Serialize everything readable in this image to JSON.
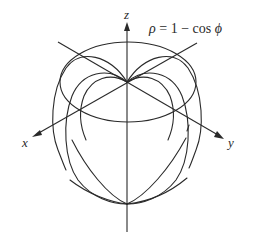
{
  "figure": {
    "equation": {
      "rho": "ρ",
      "rest": " = 1 − cos ",
      "phi": "ϕ"
    },
    "axis_labels": {
      "x": "x",
      "y": "y",
      "z": "z"
    },
    "colors": {
      "stroke": "#2a2a2a",
      "background": "#ffffff"
    },
    "geometry": {
      "origin": [
        127,
        82
      ],
      "bottom_point": [
        127,
        204
      ],
      "equator_ellipse": {
        "cx": 128,
        "cy": 82,
        "rx": 68,
        "ry": 40
      }
    }
  }
}
